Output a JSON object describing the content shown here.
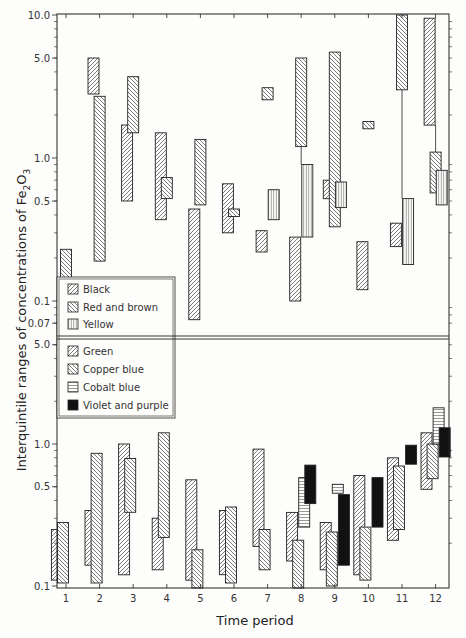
{
  "chart_data": {
    "type": "bar",
    "subtype": "floating-range (interquintile) bars, log scale, two stacked panels",
    "xlabel": "Time period",
    "ylabel": "Interquintile ranges of concentrations of Fe2O3",
    "ylabel_parts": {
      "main": "Interquintile ranges of concentrations of Fe",
      "sub1": "2",
      "mid": "O",
      "sub2": "3"
    },
    "categories": [
      "1",
      "2",
      "3",
      "4",
      "5",
      "6",
      "7",
      "8",
      "9",
      "10",
      "11",
      "12"
    ],
    "panels": [
      {
        "name": "upper",
        "yscale": "log",
        "ylim": [
          0.065,
          10.0
        ],
        "yticks": [
          {
            "value": 10.0,
            "label": "10.0"
          },
          {
            "value": 5.0,
            "label": "5.0"
          },
          {
            "value": 1.0,
            "label": "1.0"
          },
          {
            "value": 0.5,
            "label": "0.5"
          },
          {
            "value": 0.1,
            "label": "0.1"
          },
          {
            "value": 0.07,
            "label": "0.07"
          }
        ],
        "legend": [
          {
            "label": "Black",
            "pattern": "diag-up"
          },
          {
            "label": "Red and brown",
            "pattern": "diag-down"
          },
          {
            "label": "Yellow",
            "pattern": "vertical"
          }
        ],
        "series": [
          {
            "name": "Black",
            "pattern": "diag-up",
            "ranges": [
              {
                "period": 2,
                "low": 2.8,
                "high": 5.0
              },
              {
                "period": 3,
                "low": 0.5,
                "high": 1.7
              },
              {
                "period": 4,
                "low": 0.37,
                "high": 1.5
              },
              {
                "period": 5,
                "low": 0.074,
                "high": 0.44
              },
              {
                "period": 6,
                "low": 0.3,
                "high": 0.66
              },
              {
                "period": 7,
                "low": 0.22,
                "high": 0.31
              },
              {
                "period": 8,
                "low": 0.1,
                "high": 0.28
              },
              {
                "period": 9,
                "low": 0.52,
                "high": 0.7
              },
              {
                "period": 10,
                "low": 0.12,
                "high": 0.26
              },
              {
                "period": 11,
                "low": 0.24,
                "high": 0.35
              },
              {
                "period": 12,
                "low": 1.7,
                "high": 9.5
              }
            ]
          },
          {
            "name": "Red and brown",
            "pattern": "diag-down",
            "ranges": [
              {
                "period": 1,
                "low": 0.13,
                "high": 0.23
              },
              {
                "period": 2,
                "low": 0.19,
                "high": 2.7
              },
              {
                "period": 3,
                "low": 1.5,
                "high": 3.7
              },
              {
                "period": 4,
                "low": 0.52,
                "high": 0.73
              },
              {
                "period": 5,
                "low": 0.47,
                "high": 1.35
              },
              {
                "period": 6,
                "low": 0.39,
                "high": 0.44
              },
              {
                "period": 7,
                "low": 2.55,
                "high": 3.1
              },
              {
                "period": 8,
                "low": 1.2,
                "high": 5.0
              },
              {
                "period": 9,
                "low": 0.33,
                "high": 5.5
              },
              {
                "period": 10,
                "low": 1.6,
                "high": 1.8
              },
              {
                "period": 11,
                "low": 3.0,
                "high": 10.0
              },
              {
                "period": 12,
                "low": 0.57,
                "high": 1.1
              }
            ]
          },
          {
            "name": "Yellow",
            "pattern": "vertical",
            "ranges": [
              {
                "period": 7,
                "low": 0.37,
                "high": 0.6
              },
              {
                "period": 8,
                "low": 0.28,
                "high": 0.9
              },
              {
                "period": 9,
                "low": 0.45,
                "high": 0.68
              },
              {
                "period": 11,
                "low": 0.18,
                "high": 0.52
              },
              {
                "period": 12,
                "low": 0.47,
                "high": 0.82
              }
            ]
          }
        ],
        "connectors": [
          {
            "period": 8,
            "from": 0.9,
            "to": 1.2
          },
          {
            "period": 11,
            "from": 0.52,
            "to": 3.0
          },
          {
            "period": 12,
            "from": 1.1,
            "to": 1.7
          }
        ]
      },
      {
        "name": "lower",
        "yscale": "log",
        "ylim": [
          0.1,
          5.0
        ],
        "yticks": [
          {
            "value": 5.0,
            "label": "5.0"
          },
          {
            "value": 1.0,
            "label": "1.0"
          },
          {
            "value": 0.5,
            "label": "0.5"
          },
          {
            "value": 0.1,
            "label": "0.1"
          }
        ],
        "legend": [
          {
            "label": "Green",
            "pattern": "diag-up"
          },
          {
            "label": "Copper blue",
            "pattern": "diag-down"
          },
          {
            "label": "Cobalt blue",
            "pattern": "horizontal"
          },
          {
            "label": "Violet and purple",
            "pattern": "solid"
          }
        ],
        "series": [
          {
            "name": "Green",
            "pattern": "diag-up",
            "ranges": [
              {
                "period": 1,
                "low": 0.11,
                "high": 0.25
              },
              {
                "period": 2,
                "low": 0.14,
                "high": 0.34
              },
              {
                "period": 3,
                "low": 0.12,
                "high": 1.0
              },
              {
                "period": 4,
                "low": 0.13,
                "high": 0.3
              },
              {
                "period": 5,
                "low": 0.11,
                "high": 0.56
              },
              {
                "period": 6,
                "low": 0.12,
                "high": 0.34
              },
              {
                "period": 7,
                "low": 0.19,
                "high": 0.92
              },
              {
                "period": 8,
                "low": 0.15,
                "high": 0.33
              },
              {
                "period": 9,
                "low": 0.13,
                "high": 0.28
              },
              {
                "period": 10,
                "low": 0.12,
                "high": 0.6
              },
              {
                "period": 11,
                "low": 0.21,
                "high": 0.8
              },
              {
                "period": 12,
                "low": 0.48,
                "high": 1.2
              }
            ]
          },
          {
            "name": "Copper blue",
            "pattern": "diag-down",
            "ranges": [
              {
                "period": 1,
                "low": 0.105,
                "high": 0.28
              },
              {
                "period": 2,
                "low": 0.105,
                "high": 0.86
              },
              {
                "period": 3,
                "low": 0.33,
                "high": 0.79
              },
              {
                "period": 4,
                "low": 0.22,
                "high": 1.2
              },
              {
                "period": 5,
                "low": 0.095,
                "high": 0.18
              },
              {
                "period": 6,
                "low": 0.105,
                "high": 0.36
              },
              {
                "period": 7,
                "low": 0.13,
                "high": 0.25
              },
              {
                "period": 8,
                "low": 0.09,
                "high": 0.21
              },
              {
                "period": 9,
                "low": 0.1,
                "high": 0.24
              },
              {
                "period": 10,
                "low": 0.11,
                "high": 0.26
              },
              {
                "period": 11,
                "low": 0.25,
                "high": 0.7
              },
              {
                "period": 12,
                "low": 0.57,
                "high": 1.0
              }
            ]
          },
          {
            "name": "Cobalt blue",
            "pattern": "horizontal",
            "ranges": [
              {
                "period": 8,
                "low": 0.26,
                "high": 0.58
              },
              {
                "period": 9,
                "low": 0.45,
                "high": 0.52
              },
              {
                "period": 12,
                "low": 1.0,
                "high": 1.8
              }
            ]
          },
          {
            "name": "Violet and purple",
            "pattern": "solid",
            "ranges": [
              {
                "period": 8,
                "low": 0.38,
                "high": 0.71
              },
              {
                "period": 9,
                "low": 0.14,
                "high": 0.44
              },
              {
                "period": 10,
                "low": 0.26,
                "high": 0.58
              },
              {
                "period": 11,
                "low": 0.72,
                "high": 0.98
              },
              {
                "period": 12,
                "low": 0.81,
                "high": 1.3
              }
            ]
          }
        ]
      }
    ],
    "grid": false,
    "legend_position": "inside left, straddling panel boundary"
  },
  "layout": {
    "plot_left": 57,
    "plot_right": 449,
    "upper_top": 14,
    "upper_bottom": 336,
    "lower_top": 339,
    "lower_bottom": 588,
    "upper_decade_px": 143,
    "upper_y_at_1": 158,
    "lower_decade_px": 142,
    "lower_y_at_1": 444,
    "period_x0": 66,
    "period_dx": 33.6,
    "bar_w": 11,
    "legend_box": {
      "x": 57,
      "y": 277,
      "w": 118,
      "h": 141
    }
  },
  "colors": {
    "ink": "#222222",
    "background": "#fdfdfb",
    "hatch": "#444444",
    "solid": "#111111"
  }
}
